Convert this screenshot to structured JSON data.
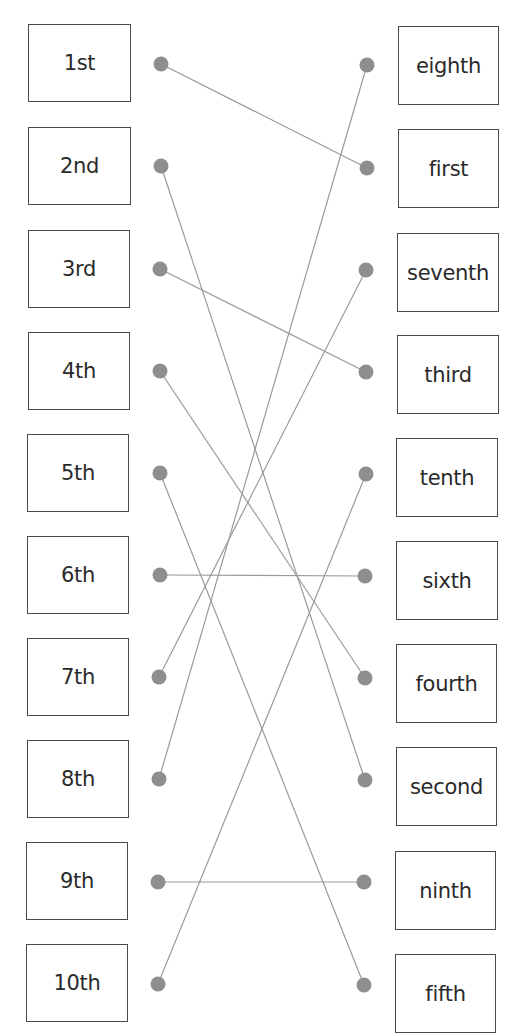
{
  "colors": {
    "line": "#9a9a9a",
    "dot": "#8e8e8e",
    "border": "#4a4a4a",
    "text": "#2a2a2a"
  },
  "left_items": [
    {
      "label": "1st",
      "box": [
        28,
        24,
        103,
        78
      ],
      "dot": [
        161,
        64
      ]
    },
    {
      "label": "2nd",
      "box": [
        28,
        127,
        103,
        78
      ],
      "dot": [
        161,
        166
      ]
    },
    {
      "label": "3rd",
      "box": [
        28,
        230,
        102,
        78
      ],
      "dot": [
        160,
        269
      ]
    },
    {
      "label": "4th",
      "box": [
        28,
        332,
        102,
        78
      ],
      "dot": [
        160,
        371
      ]
    },
    {
      "label": "5th",
      "box": [
        27,
        434,
        102,
        78
      ],
      "dot": [
        160,
        473
      ]
    },
    {
      "label": "6th",
      "box": [
        27,
        536,
        102,
        78
      ],
      "dot": [
        160,
        575
      ]
    },
    {
      "label": "7th",
      "box": [
        27,
        638,
        102,
        78
      ],
      "dot": [
        159,
        677
      ]
    },
    {
      "label": "8th",
      "box": [
        27,
        740,
        102,
        78
      ],
      "dot": [
        159,
        779
      ]
    },
    {
      "label": "9th",
      "box": [
        26,
        842,
        102,
        78
      ],
      "dot": [
        158,
        882
      ]
    },
    {
      "label": "10th",
      "box": [
        26,
        944,
        102,
        78
      ],
      "dot": [
        158,
        984
      ]
    }
  ],
  "right_items": [
    {
      "label": "eighth",
      "box": [
        398,
        26,
        101,
        79
      ],
      "dot": [
        367,
        65
      ]
    },
    {
      "label": "first",
      "box": [
        398,
        129,
        101,
        79
      ],
      "dot": [
        367,
        168
      ]
    },
    {
      "label": "seventh",
      "box": [
        397,
        233,
        102,
        79
      ],
      "dot": [
        366,
        270
      ]
    },
    {
      "label": "third",
      "box": [
        397,
        335,
        102,
        79
      ],
      "dot": [
        366,
        372
      ]
    },
    {
      "label": "tenth",
      "box": [
        396,
        438,
        102,
        79
      ],
      "dot": [
        366,
        474
      ]
    },
    {
      "label": "sixth",
      "box": [
        396,
        541,
        102,
        79
      ],
      "dot": [
        365,
        576
      ]
    },
    {
      "label": "fourth",
      "box": [
        396,
        644,
        101,
        79
      ],
      "dot": [
        365,
        678
      ]
    },
    {
      "label": "second",
      "box": [
        396,
        747,
        101,
        79
      ],
      "dot": [
        365,
        780
      ]
    },
    {
      "label": "ninth",
      "box": [
        395,
        851,
        101,
        79
      ],
      "dot": [
        364,
        882
      ]
    },
    {
      "label": "fifth",
      "box": [
        395,
        954,
        101,
        79
      ],
      "dot": [
        364,
        985
      ]
    }
  ],
  "connections": [
    {
      "from": "1st",
      "to": "first"
    },
    {
      "from": "2nd",
      "to": "second"
    },
    {
      "from": "3rd",
      "to": "third"
    },
    {
      "from": "4th",
      "to": "fourth"
    },
    {
      "from": "5th",
      "to": "fifth"
    },
    {
      "from": "6th",
      "to": "sixth"
    },
    {
      "from": "7th",
      "to": "seventh"
    },
    {
      "from": "8th",
      "to": "eighth"
    },
    {
      "from": "9th",
      "to": "ninth"
    },
    {
      "from": "10th",
      "to": "tenth"
    }
  ]
}
